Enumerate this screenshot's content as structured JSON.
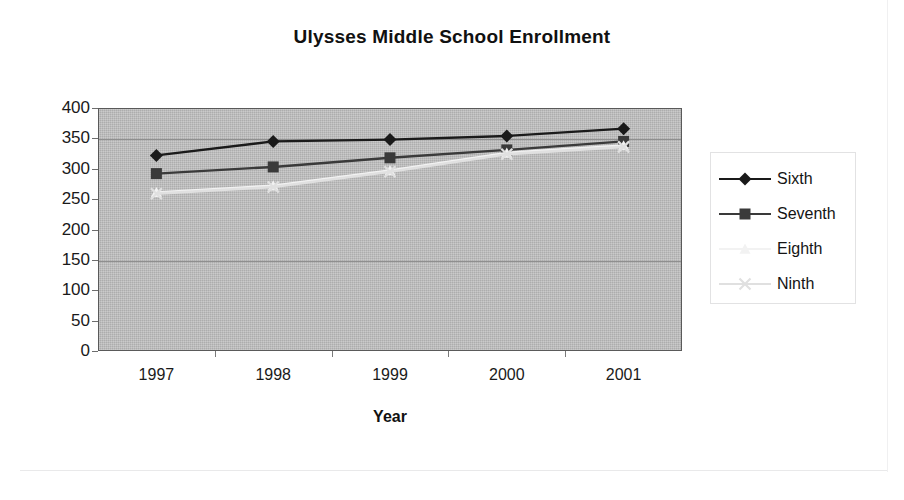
{
  "chart_data": {
    "type": "line",
    "title": "Ulysses Middle School Enrollment",
    "xlabel": "Year",
    "ylabel": "",
    "categories": [
      "1997",
      "1998",
      "1999",
      "2000",
      "2001"
    ],
    "ylim": [
      0,
      400
    ],
    "yticks": [
      0,
      50,
      100,
      150,
      200,
      250,
      300,
      350,
      400
    ],
    "grid": true,
    "legend_position": "right",
    "plot_background": "#bdbdbd",
    "series": [
      {
        "name": "Sixth",
        "marker": "diamond",
        "color": "#1a1a1a",
        "values": [
          322,
          345,
          348,
          354,
          366
        ]
      },
      {
        "name": "Seventh",
        "marker": "square",
        "color": "#3a3a3a",
        "values": [
          292,
          303,
          318,
          331,
          345
        ]
      },
      {
        "name": "Eighth",
        "marker": "triangle",
        "color": "#f2f2f2",
        "values": [
          261,
          272,
          297,
          326,
          338
        ]
      },
      {
        "name": "Ninth",
        "marker": "cross",
        "color": "#e0e0e0",
        "values": [
          259,
          270,
          295,
          324,
          336
        ]
      }
    ]
  },
  "axis": {
    "y_tick_labels": [
      "400",
      "350",
      "300",
      "250",
      "200",
      "150",
      "100",
      "50",
      "0"
    ],
    "x_tick_labels": [
      "1997",
      "1998",
      "1999",
      "2000",
      "2001"
    ],
    "x_axis_title": "Year"
  },
  "legend": {
    "entries": [
      {
        "label": "Sixth"
      },
      {
        "label": "Seventh"
      },
      {
        "label": "Eighth"
      },
      {
        "label": "Ninth"
      }
    ]
  }
}
